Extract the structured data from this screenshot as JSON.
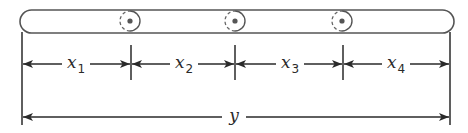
{
  "diagram": {
    "type": "beam-dimension-diagram",
    "colors": {
      "stroke": "#3a3a3a",
      "fill": "#ffffff",
      "pin_dot": "#555555"
    },
    "bar": {
      "x_left": 20,
      "x_right": 454,
      "y_top": 10,
      "y_bottom": 33
    },
    "pins": [
      {
        "name": "pin-1",
        "cx": 130,
        "cy": 21,
        "r": 10
      },
      {
        "name": "pin-2",
        "cx": 235,
        "cy": 21,
        "r": 10
      },
      {
        "name": "pin-3",
        "cx": 342,
        "cy": 21,
        "r": 10
      }
    ],
    "segments": [
      {
        "label": "x",
        "subscript": "1",
        "from": 22,
        "to": 131,
        "label_x": 76
      },
      {
        "label": "x",
        "subscript": "2",
        "from": 131,
        "to": 235,
        "label_x": 184
      },
      {
        "label": "x",
        "subscript": "3",
        "from": 235,
        "to": 343,
        "label_x": 290
      },
      {
        "label": "x",
        "subscript": "4",
        "from": 343,
        "to": 450,
        "label_x": 396
      }
    ],
    "segment_row_y": 64,
    "total": {
      "label": "y",
      "from": 22,
      "to": 450,
      "row_y": 117,
      "label_x": 234
    }
  }
}
